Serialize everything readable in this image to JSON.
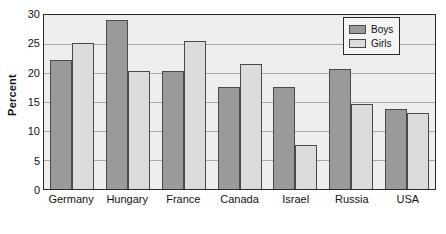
{
  "chart_data": {
    "type": "bar",
    "title": "",
    "subtitle": "",
    "xlabel": "",
    "ylabel": "Percent",
    "ylim": [
      0,
      30
    ],
    "ytick_step": 5,
    "yticks": [
      0,
      5,
      10,
      15,
      20,
      25,
      30
    ],
    "ytick_labels": [
      "0",
      "5",
      "10",
      "15",
      "20",
      "25",
      "30"
    ],
    "categories": [
      "Germany",
      "Hungary",
      "France",
      "Canada",
      "Israel",
      "Russia",
      "USA"
    ],
    "series": [
      {
        "name": "Boys",
        "color": "#9a9a9a",
        "values": [
          22.0,
          29.0,
          20.2,
          17.4,
          17.5,
          20.5,
          13.7
        ]
      },
      {
        "name": "Girls",
        "color": "#dcdcdc",
        "values": [
          25.0,
          20.2,
          25.3,
          21.3,
          7.4,
          14.5,
          13.0
        ]
      }
    ],
    "grid": true,
    "grid_axis": "y",
    "legend_position": "top-right",
    "plot_background": "#eeeeee",
    "frame_color": "#2b2b2b",
    "gridline_color": "#a8a8a8",
    "bar_border_color": "#4a4a4a"
  },
  "legend": {
    "entries": [
      {
        "label": "Boys"
      },
      {
        "label": "Girls"
      }
    ]
  }
}
